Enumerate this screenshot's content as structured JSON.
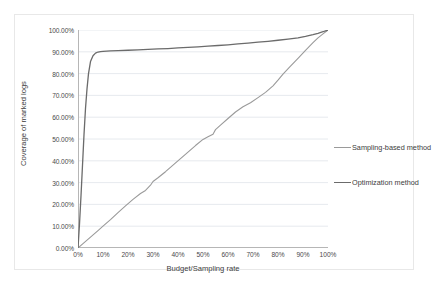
{
  "chart_data": {
    "type": "line",
    "title": "",
    "xlabel": "Budget/Sampling rate",
    "ylabel": "Coverage of marked logs",
    "xlim": [
      0,
      100
    ],
    "ylim": [
      0,
      100
    ],
    "grid": true,
    "grid_axis": "y",
    "legend_position": "right",
    "x_tick_labels": [
      "0%",
      "10%",
      "20%",
      "30%",
      "40%",
      "50%",
      "60%",
      "70%",
      "80%",
      "90%",
      "100%"
    ],
    "x_tick_values": [
      0,
      10,
      20,
      30,
      40,
      50,
      60,
      70,
      80,
      90,
      100
    ],
    "y_tick_labels": [
      "0.00%",
      "10.00%",
      "20.00%",
      "30.00%",
      "40.00%",
      "50.00%",
      "60.00%",
      "70.00%",
      "80.00%",
      "90.00%",
      "100.00%"
    ],
    "y_tick_values": [
      0,
      10,
      20,
      30,
      40,
      50,
      60,
      70,
      80,
      90,
      100
    ],
    "series": [
      {
        "name": "Sampling-based method",
        "color": "#9a9a9a",
        "width": 1.1,
        "x": [
          0,
          2,
          5,
          8,
          10,
          13,
          16,
          19,
          22,
          25,
          27,
          29,
          30,
          32,
          35,
          38,
          41,
          44,
          47,
          50,
          52,
          54,
          55,
          57,
          60,
          63,
          66,
          69,
          72,
          75,
          78,
          80,
          82,
          85,
          88,
          91,
          94,
          96,
          98,
          100
        ],
        "y": [
          0,
          2.0,
          5.0,
          8.0,
          10.0,
          13.0,
          16.2,
          19.3,
          22.3,
          25.0,
          26.4,
          28.8,
          30.5,
          32.2,
          35.0,
          38.0,
          41.0,
          44.0,
          47.0,
          49.8,
          51.0,
          52.2,
          54.3,
          56.4,
          59.4,
          62.4,
          64.8,
          66.6,
          69.0,
          71.4,
          74.4,
          77.0,
          79.8,
          83.4,
          87.0,
          90.6,
          94.2,
          96.4,
          98.2,
          100
        ]
      },
      {
        "name": "Optimization  method",
        "color": "#6b6b6b",
        "width": 1.3,
        "x": [
          0,
          0.6,
          1.2,
          1.8,
          2.4,
          3.0,
          3.6,
          4.2,
          5.0,
          6.0,
          7.0,
          8.0,
          9.0,
          10.0,
          13,
          16,
          20,
          24,
          28,
          32,
          36,
          40,
          44,
          48,
          52,
          56,
          60,
          64,
          68,
          72,
          76,
          80,
          84,
          88,
          91,
          94,
          96,
          98,
          100
        ],
        "y": [
          0,
          11,
          24,
          38,
          52,
          64,
          73,
          80,
          85.5,
          88.2,
          89.4,
          89.9,
          90.1,
          90.2,
          90.4,
          90.5,
          90.7,
          90.9,
          91.1,
          91.3,
          91.5,
          91.8,
          92.0,
          92.3,
          92.6,
          92.9,
          93.2,
          93.6,
          94.0,
          94.4,
          94.8,
          95.3,
          95.8,
          96.4,
          97.1,
          97.9,
          98.5,
          99.2,
          100
        ]
      }
    ]
  },
  "legend": {
    "items": [
      {
        "label": "Sampling-based method",
        "color": "#9a9a9a",
        "width": 1.1,
        "top": 0
      },
      {
        "label": "Optimization  method",
        "color": "#6b6b6b",
        "width": 1.6,
        "top": 35
      }
    ]
  },
  "axes": {
    "x_title": "Budget/Sampling rate",
    "y_title": "Coverage of marked logs"
  },
  "style": {
    "gridline_color": "#dfe4ea",
    "axis_line_color": "#b6b6b6",
    "frame_color": "#e8e8e8",
    "tick_text_color": "#4a4a4a",
    "title_text_color": "#3c3c3c",
    "plot_background": "#ffffff"
  }
}
